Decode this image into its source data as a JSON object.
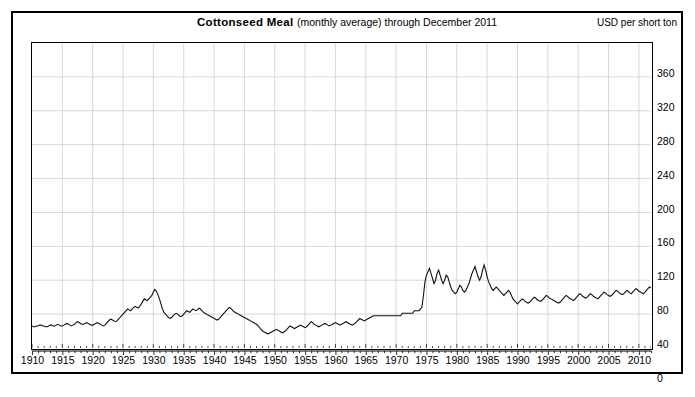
{
  "chart_data": {
    "type": "line",
    "title": "Cottonseed Meal (monthly average) through December 2011",
    "title_main": "Cottonseed Meal ",
    "title_sub": "(monthly average) through December 2011",
    "xlabel": "",
    "ylabel": "USD per short ton",
    "ylim": [
      0,
      360
    ],
    "xlim": [
      1910,
      2012
    ],
    "y_ticks": [
      0,
      40,
      80,
      120,
      160,
      200,
      240,
      280,
      320,
      360
    ],
    "x_ticks": [
      1910,
      1915,
      1920,
      1925,
      1930,
      1935,
      1940,
      1945,
      1950,
      1955,
      1960,
      1965,
      1970,
      1975,
      1980,
      1985,
      1990,
      1995,
      2000,
      2005,
      2010
    ],
    "grid": true,
    "legend": "none",
    "line_color": "#111111",
    "background_color": "#ffffff",
    "series_name": "Cottonseed Meal price",
    "x_start": 1910.0,
    "x_step": 0.25,
    "values": [
      26,
      25,
      25,
      26,
      26,
      27,
      27,
      26,
      26,
      25,
      25,
      26,
      27,
      27,
      26,
      26,
      27,
      28,
      27,
      26,
      26,
      27,
      28,
      29,
      28,
      27,
      26,
      27,
      28,
      30,
      31,
      30,
      29,
      28,
      28,
      29,
      30,
      29,
      28,
      27,
      27,
      28,
      29,
      30,
      29,
      28,
      27,
      26,
      27,
      29,
      31,
      33,
      34,
      33,
      32,
      31,
      32,
      34,
      36,
      38,
      40,
      42,
      44,
      46,
      45,
      44,
      46,
      48,
      49,
      48,
      47,
      49,
      52,
      55,
      58,
      57,
      56,
      58,
      60,
      62,
      66,
      69,
      67,
      63,
      58,
      52,
      46,
      42,
      40,
      38,
      36,
      35,
      36,
      38,
      40,
      41,
      40,
      38,
      37,
      38,
      40,
      42,
      44,
      43,
      42,
      44,
      46,
      45,
      44,
      45,
      47,
      46,
      44,
      42,
      41,
      40,
      39,
      38,
      37,
      36,
      35,
      34,
      33,
      34,
      36,
      38,
      40,
      42,
      44,
      46,
      48,
      47,
      45,
      43,
      42,
      41,
      40,
      39,
      38,
      37,
      36,
      35,
      34,
      33,
      32,
      31,
      30,
      29,
      28,
      26,
      24,
      22,
      20,
      19,
      18,
      17,
      17,
      18,
      19,
      20,
      21,
      22,
      21,
      20,
      19,
      18,
      19,
      20,
      22,
      24,
      26,
      25,
      24,
      23,
      24,
      25,
      26,
      27,
      26,
      25,
      24,
      25,
      27,
      29,
      31,
      30,
      28,
      27,
      26,
      25,
      26,
      27,
      28,
      29,
      28,
      27,
      26,
      27,
      28,
      29,
      30,
      29,
      28,
      27,
      28,
      29,
      30,
      31,
      30,
      29,
      28,
      27,
      28,
      29,
      31,
      33,
      35,
      34,
      33,
      32,
      33,
      34,
      35,
      36,
      37,
      38,
      38,
      38,
      38,
      38,
      38,
      38,
      38,
      38,
      38,
      38,
      38,
      38,
      38,
      38,
      38,
      38,
      38,
      38,
      41,
      41,
      41,
      41,
      41,
      41,
      41,
      41,
      44,
      44,
      44,
      44,
      46,
      48,
      62,
      78,
      86,
      90,
      94,
      88,
      82,
      76,
      80,
      88,
      92,
      86,
      80,
      76,
      80,
      86,
      84,
      78,
      72,
      68,
      66,
      64,
      66,
      70,
      74,
      72,
      68,
      66,
      68,
      72,
      76,
      82,
      88,
      92,
      96,
      90,
      84,
      80,
      84,
      92,
      98,
      92,
      84,
      78,
      74,
      70,
      68,
      70,
      72,
      70,
      68,
      66,
      64,
      62,
      64,
      66,
      68,
      66,
      62,
      58,
      56,
      54,
      52,
      54,
      56,
      58,
      57,
      55,
      54,
      53,
      54,
      56,
      58,
      60,
      59,
      57,
      56,
      55,
      56,
      58,
      60,
      62,
      61,
      59,
      58,
      57,
      56,
      55,
      54,
      53,
      54,
      56,
      58,
      60,
      62,
      61,
      59,
      58,
      57,
      56,
      58,
      60,
      62,
      64,
      63,
      61,
      60,
      59,
      60,
      62,
      64,
      63,
      61,
      60,
      59,
      58,
      60,
      62,
      64,
      66,
      65,
      63,
      62,
      61,
      62,
      64,
      66,
      68,
      67,
      65,
      64,
      63,
      64,
      66,
      68,
      67,
      65,
      64,
      66,
      68,
      70,
      69,
      67,
      66,
      65,
      64,
      66,
      68,
      70,
      72,
      71,
      69,
      68,
      67,
      68,
      70,
      72,
      74,
      73,
      71,
      70,
      69,
      70,
      72,
      74,
      76,
      75,
      73,
      72,
      71,
      72,
      74,
      76,
      78,
      80,
      85,
      95,
      110,
      130,
      160,
      190,
      215,
      205,
      185,
      165,
      150,
      140,
      130,
      125,
      122,
      120,
      125,
      135,
      150,
      160,
      170,
      165,
      155,
      150,
      145,
      140,
      135,
      138,
      145,
      155,
      165,
      175,
      185,
      190,
      180,
      170,
      160,
      150,
      145,
      140,
      135,
      132,
      130,
      135,
      142,
      150,
      158,
      165,
      172,
      180,
      186,
      180,
      172,
      165,
      158,
      152,
      148,
      145,
      150,
      158,
      168,
      178,
      188,
      196,
      204,
      210,
      215,
      225,
      232,
      225,
      215,
      205,
      195,
      185,
      175,
      168,
      162,
      158,
      155,
      160,
      168,
      178,
      190,
      200,
      210,
      218,
      226,
      234,
      228,
      218,
      205,
      192,
      180,
      168,
      158,
      148,
      140,
      132,
      124,
      116,
      108,
      100,
      92,
      86,
      80,
      76,
      80,
      88,
      96,
      104,
      112,
      120,
      128,
      136,
      144,
      152,
      160,
      168,
      176,
      184,
      190,
      196,
      190,
      182,
      172,
      162,
      152,
      142,
      134,
      126,
      120,
      114,
      108,
      102,
      96,
      90,
      86,
      84,
      88,
      96,
      106,
      116,
      126,
      136,
      146,
      156,
      166,
      172,
      178,
      184,
      190,
      186,
      180,
      172,
      164,
      156,
      148,
      142,
      136,
      132,
      128,
      126,
      130,
      138,
      148,
      158,
      168,
      176,
      184,
      190,
      196,
      202,
      196,
      188,
      178,
      168,
      158,
      148,
      140,
      132,
      126,
      122,
      118,
      116,
      120,
      128,
      138,
      148,
      158,
      166,
      174,
      182,
      190,
      198,
      206,
      214,
      208,
      198,
      186,
      174,
      162,
      150,
      140,
      132,
      126,
      122,
      120,
      124,
      132,
      142,
      152,
      162,
      172,
      180,
      188,
      196,
      204,
      210,
      204,
      194,
      182,
      170,
      158,
      148,
      140,
      134,
      130,
      128,
      132,
      140,
      150,
      160,
      170,
      178,
      186,
      192,
      198,
      204,
      198,
      188,
      176,
      164,
      152,
      142,
      134,
      128,
      124,
      122,
      126,
      134,
      144,
      154,
      164,
      172,
      180,
      186,
      192,
      188,
      180,
      170,
      160,
      150,
      142,
      136,
      132,
      130,
      134,
      142,
      152,
      162,
      172,
      180,
      188,
      194,
      200,
      206,
      212,
      206,
      196,
      184,
      172,
      160,
      150,
      142,
      136,
      132,
      136,
      144,
      154,
      164,
      174,
      182,
      190,
      196,
      202,
      208,
      214,
      220,
      226,
      232,
      240,
      248,
      256,
      264,
      272,
      280,
      290,
      300,
      312,
      324,
      334,
      320,
      300,
      280,
      258,
      238,
      220,
      205,
      192,
      182,
      176,
      172,
      178,
      190,
      204,
      218,
      232,
      246,
      258,
      268,
      280,
      292,
      306,
      320,
      334,
      348,
      330,
      305,
      280,
      258,
      240,
      228,
      220,
      224,
      230,
      236,
      232
    ],
    "annotations": []
  }
}
